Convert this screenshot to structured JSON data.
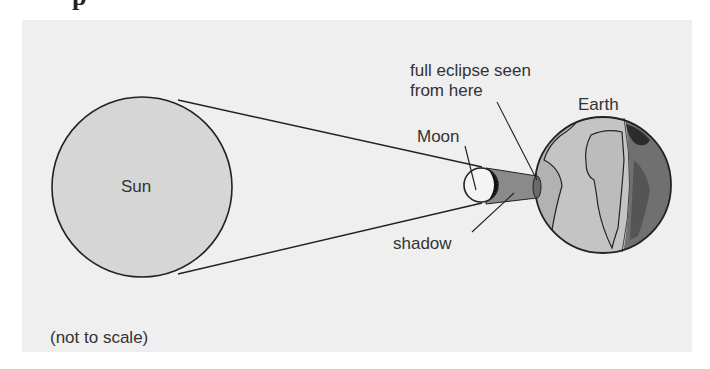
{
  "heading": {
    "fragment": "p"
  },
  "diagram": {
    "labels": {
      "sun": "Sun",
      "moon": "Moon",
      "earth": "Earth",
      "full_eclipse_line1": "full eclipse seen",
      "full_eclipse_line2": "from here",
      "shadow": "shadow",
      "note": "(not to scale)"
    },
    "colors": {
      "panel": "#efefef",
      "sun_fill": "#d6d6d6",
      "outline": "#222222",
      "moon_fill": "#f4f4f4",
      "moon_dark": "#111111",
      "shadow_cone": "#8a8a8a",
      "earth_land": "#b0b0b0",
      "earth_day_ocean": "#c8c8c8",
      "earth_night": "#6e6e6e",
      "earth_night_dark": "#333333"
    }
  }
}
